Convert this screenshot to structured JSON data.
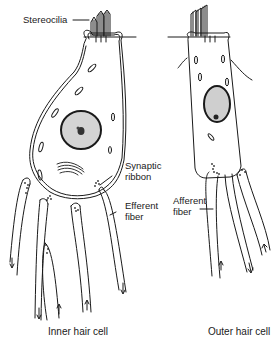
{
  "diagram": {
    "labels": {
      "stereocilia": "Stereocilia",
      "synaptic_ribbon_1": "Synaptic",
      "synaptic_ribbon_2": "ribbon",
      "efferent_fiber_1": "Efferent",
      "efferent_fiber_2": "fiber",
      "afferent_fiber_1": "Afferent",
      "afferent_fiber_2": "fiber"
    },
    "captions": {
      "inner": "Inner hair cell",
      "outer": "Outer hair cell"
    },
    "colors": {
      "ink": "#1a1a1a",
      "background": "#ffffff",
      "nucleus_fill": "#cfcfcf"
    }
  }
}
